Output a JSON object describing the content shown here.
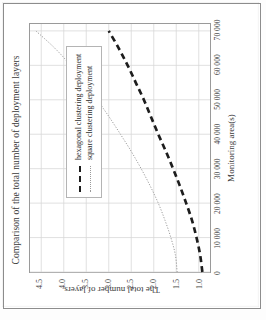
{
  "figure": {
    "title": "Comparison of the total number of deployment layers",
    "orientation": "rotated-90-ccw"
  },
  "legend": {
    "items": [
      {
        "label": "hexagonal clustering deployment",
        "style": "thick-dashed",
        "color": "#1d1d1d"
      },
      {
        "label": "square clustering deployment",
        "style": "thin-dotted",
        "color": "#9a9a9a"
      }
    ]
  },
  "axes": {
    "x_title": "Monitoring area(s)",
    "y_title": "The total number of layers",
    "x_ticks": [
      "0",
      "10 000",
      "20 000",
      "30 000",
      "40 000",
      "50 000",
      "60 000",
      "70 000"
    ],
    "y_ticks": [
      "1.0",
      "1.5",
      "2.0",
      "2.5",
      "3.0",
      "3.5",
      "4.0",
      "4.5"
    ]
  },
  "chart_data": {
    "type": "line",
    "title": "Comparison of the total number of deployment layers",
    "xlabel": "Monitoring area(s)",
    "ylabel": "The total number of layers",
    "xlim": [
      0,
      72000
    ],
    "ylim": [
      0.75,
      4.75
    ],
    "grid": true,
    "legend_position": "upper-left-inside",
    "x": [
      0,
      5000,
      10000,
      15000,
      20000,
      25000,
      30000,
      35000,
      40000,
      45000,
      50000,
      55000,
      60000,
      65000,
      70000
    ],
    "series": [
      {
        "name": "square clustering deployment",
        "style": "thin-dotted",
        "color": "#9a9a9a",
        "values": [
          1.48,
          1.52,
          1.62,
          1.75,
          1.9,
          2.08,
          2.28,
          2.5,
          2.74,
          2.99,
          3.26,
          3.55,
          3.85,
          4.2,
          4.62
        ]
      },
      {
        "name": "hexagonal clustering deployment",
        "style": "thick-dashed",
        "color": "#1d1d1d",
        "values": [
          0.92,
          0.97,
          1.05,
          1.15,
          1.28,
          1.42,
          1.57,
          1.73,
          1.9,
          2.06,
          2.22,
          2.4,
          2.58,
          2.78,
          3.0
        ]
      }
    ]
  }
}
